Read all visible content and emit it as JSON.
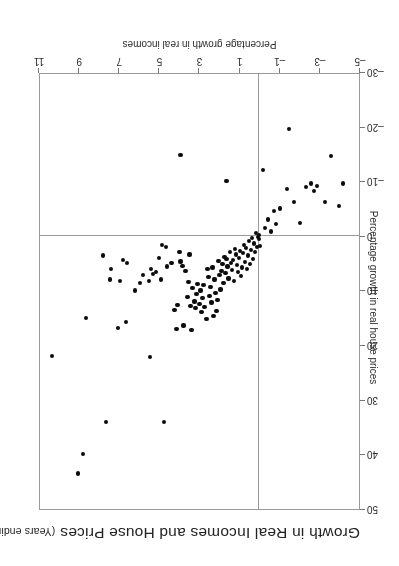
{
  "figure": {
    "orientation": "rotated-180",
    "title_main": "Growth in Real Incomes and House Prices",
    "title_sub": "(Years ending 1957 Q1 – 1988 Q1)",
    "point_color": "#0c0c0c",
    "axis_color": "#9a9a9a"
  },
  "chart_data": {
    "type": "scatter",
    "subtitle": "(Years ending 1957 Q1 – 1988 Q1)",
    "xlabel": "Percentage growth in real incomes",
    "ylabel": "Percentage growth in real house prices",
    "xlim": [
      -5,
      11
    ],
    "ylim": [
      -30,
      50
    ],
    "xticks": [
      -5,
      -3,
      -1,
      1,
      3,
      5,
      7,
      9,
      11
    ],
    "xticklabels": [
      "–5",
      "–3",
      "–1",
      "1",
      "3",
      "5",
      "7",
      "9",
      "11"
    ],
    "yticks": [
      -30,
      -20,
      -10,
      0,
      10,
      20,
      30,
      40,
      50
    ],
    "yticklabels": [
      "–30",
      "–20",
      "–10",
      "0",
      "10",
      "20",
      "30",
      "40",
      "50"
    ],
    "grid": false,
    "legend": null,
    "reference_lines": {
      "x": 0,
      "y": 0
    },
    "n_points": 125,
    "series": [
      {
        "name": "Years ending 1957 Q1 - 1988 Q1",
        "points": [
          [
            9.0,
            43.5
          ],
          [
            8.75,
            40.0
          ],
          [
            10.3,
            22.0
          ],
          [
            7.6,
            34.0
          ],
          [
            5.4,
            22.2
          ],
          [
            4.7,
            34.0
          ],
          [
            8.6,
            15.0
          ],
          [
            7.0,
            16.8
          ],
          [
            6.6,
            15.8
          ],
          [
            4.1,
            17.0
          ],
          [
            3.75,
            16.4
          ],
          [
            3.35,
            17.3
          ],
          [
            7.75,
            3.6
          ],
          [
            7.4,
            8.0
          ],
          [
            7.35,
            6.0
          ],
          [
            6.9,
            8.3
          ],
          [
            6.75,
            4.4
          ],
          [
            6.55,
            5.0
          ],
          [
            6.15,
            10.0
          ],
          [
            5.9,
            8.6
          ],
          [
            5.75,
            7.1
          ],
          [
            5.45,
            8.2
          ],
          [
            5.35,
            6.0
          ],
          [
            5.25,
            7.0
          ],
          [
            5.1,
            6.6
          ],
          [
            4.95,
            4.0
          ],
          [
            4.85,
            8.0
          ],
          [
            4.8,
            1.7
          ],
          [
            4.6,
            2.0
          ],
          [
            4.55,
            5.6
          ],
          [
            4.35,
            5.0
          ],
          [
            4.2,
            13.6
          ],
          [
            4.05,
            12.6
          ],
          [
            3.95,
            3.0
          ],
          [
            3.9,
            4.7
          ],
          [
            3.8,
            5.5
          ],
          [
            3.65,
            6.5
          ],
          [
            3.55,
            11.2
          ],
          [
            3.5,
            8.4
          ],
          [
            3.45,
            3.4
          ],
          [
            3.4,
            12.8
          ],
          [
            3.3,
            9.6
          ],
          [
            3.2,
            12.0
          ],
          [
            3.15,
            13.2
          ],
          [
            3.1,
            10.6
          ],
          [
            3.05,
            8.8
          ],
          [
            2.95,
            12.4
          ],
          [
            2.9,
            10.0
          ],
          [
            2.85,
            14.0
          ],
          [
            2.8,
            11.4
          ],
          [
            2.75,
            9.0
          ],
          [
            2.7,
            13.0
          ],
          [
            2.6,
            15.2
          ],
          [
            2.55,
            6.0
          ],
          [
            2.5,
            7.6
          ],
          [
            2.45,
            11.0
          ],
          [
            2.4,
            9.4
          ],
          [
            2.35,
            12.2
          ],
          [
            2.3,
            5.8
          ],
          [
            2.25,
            14.6
          ],
          [
            2.2,
            8.0
          ],
          [
            2.15,
            10.4
          ],
          [
            2.1,
            13.8
          ],
          [
            2.05,
            11.8
          ],
          [
            2.0,
            4.6
          ],
          [
            1.95,
            7.2
          ],
          [
            1.9,
            9.8
          ],
          [
            1.85,
            6.4
          ],
          [
            1.8,
            5.2
          ],
          [
            1.75,
            8.6
          ],
          [
            1.7,
            3.8
          ],
          [
            1.65,
            6.8
          ],
          [
            1.6,
            4.2
          ],
          [
            1.55,
            5.6
          ],
          [
            1.5,
            7.8
          ],
          [
            1.45,
            3.0
          ],
          [
            1.4,
            5.0
          ],
          [
            1.35,
            6.2
          ],
          [
            1.3,
            4.4
          ],
          [
            1.25,
            8.2
          ],
          [
            1.2,
            2.4
          ],
          [
            1.15,
            3.4
          ],
          [
            1.1,
            5.4
          ],
          [
            1.05,
            6.6
          ],
          [
            1.0,
            4.0
          ],
          [
            0.95,
            2.8
          ],
          [
            0.9,
            7.4
          ],
          [
            0.85,
            5.8
          ],
          [
            0.8,
            3.2
          ],
          [
            0.75,
            1.6
          ],
          [
            0.7,
            4.8
          ],
          [
            0.65,
            2.2
          ],
          [
            0.6,
            6.0
          ],
          [
            0.55,
            3.6
          ],
          [
            0.5,
            1.0
          ],
          [
            0.45,
            5.2
          ],
          [
            0.4,
            2.6
          ],
          [
            0.35,
            0.4
          ],
          [
            0.3,
            4.2
          ],
          [
            0.25,
            1.4
          ],
          [
            0.2,
            3.0
          ],
          [
            0.15,
            -0.6
          ],
          [
            0.1,
            2.0
          ],
          [
            0.05,
            0.2
          ],
          [
            0.0,
            0.6
          ],
          [
            0.0,
            -0.2
          ],
          [
            -0.05,
            1.8
          ],
          [
            -0.3,
            -1.4
          ],
          [
            -0.45,
            -3.0
          ],
          [
            -0.6,
            -0.8
          ],
          [
            -0.75,
            -4.6
          ],
          [
            -0.85,
            -2.2
          ],
          [
            -1.05,
            -5.0
          ],
          [
            -1.4,
            -8.6
          ],
          [
            -1.75,
            -6.2
          ],
          [
            -2.05,
            -2.4
          ],
          [
            -2.35,
            -9.0
          ],
          [
            -2.6,
            -9.6
          ],
          [
            -2.75,
            -8.2
          ],
          [
            -2.9,
            -9.2
          ],
          [
            -3.3,
            -6.2
          ],
          [
            -3.6,
            -14.6
          ],
          [
            -4.0,
            -5.4
          ],
          [
            -4.2,
            -9.6
          ],
          [
            -0.2,
            -12.0
          ],
          [
            1.6,
            -10.0
          ],
          [
            3.9,
            -14.8
          ],
          [
            -1.5,
            -19.6
          ]
        ]
      }
    ]
  },
  "x_axis": {
    "title": "Percentage growth in real incomes",
    "ticks": [
      {
        "value": -5,
        "label": "–5"
      },
      {
        "value": -3,
        "label": "–3"
      },
      {
        "value": -1,
        "label": "–1"
      },
      {
        "value": 1,
        "label": "1"
      },
      {
        "value": 3,
        "label": "3"
      },
      {
        "value": 5,
        "label": "5"
      },
      {
        "value": 7,
        "label": "7"
      },
      {
        "value": 9,
        "label": "9"
      },
      {
        "value": 11,
        "label": "11"
      }
    ]
  },
  "y_axis": {
    "title": "Percentage growth in real house prices",
    "ticks": [
      {
        "value": 50,
        "label": "50"
      },
      {
        "value": 40,
        "label": "40"
      },
      {
        "value": 30,
        "label": "30"
      },
      {
        "value": 20,
        "label": "20"
      },
      {
        "value": 10,
        "label": "10"
      },
      {
        "value": 0,
        "label": "0"
      },
      {
        "value": -10,
        "label": "–10"
      },
      {
        "value": -20,
        "label": "–20"
      },
      {
        "value": -30,
        "label": "–30"
      }
    ]
  }
}
